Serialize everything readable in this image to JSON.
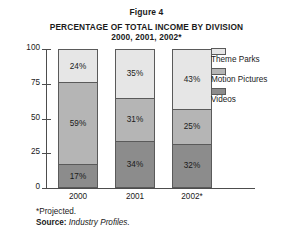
{
  "figure": {
    "label": "Figure 4",
    "title": "PERCENTAGE OF TOTAL INCOME BY DIVISION",
    "subtitle": "2000, 2001, 2002*"
  },
  "notes": {
    "projected": "*Projected.",
    "source_label": "Source:",
    "source_value": "Industry Profiles."
  },
  "legend": {
    "position": "right",
    "items": [
      {
        "label": "Theme Parks",
        "color": "#e6e6e6"
      },
      {
        "label": "Motion Pictures",
        "color": "#b5b5b5"
      },
      {
        "label": "Videos",
        "color": "#8c8c8c"
      }
    ]
  },
  "chart_data": {
    "type": "bar",
    "variant": "stacked-vertical",
    "title": "PERCENTAGE OF TOTAL INCOME BY DIVISION",
    "subtitle": "2000, 2001, 2002*",
    "xlabel": "",
    "ylabel": "",
    "ylim": [
      0,
      100
    ],
    "yticks": [
      0,
      25,
      50,
      75,
      100
    ],
    "ytick_labels": [
      "0",
      "25",
      "50",
      "75",
      "100"
    ],
    "grid": false,
    "legend_position": "right",
    "categories": [
      "2000",
      "2001",
      "2002*"
    ],
    "series": [
      {
        "name": "Videos",
        "color": "#8c8c8c",
        "values": [
          17,
          34,
          32
        ],
        "labels": [
          "17%",
          "34%",
          "32%"
        ]
      },
      {
        "name": "Motion Pictures",
        "color": "#b5b5b5",
        "values": [
          59,
          31,
          25
        ],
        "labels": [
          "59%",
          "31%",
          "25%"
        ]
      },
      {
        "name": "Theme Parks",
        "color": "#e6e6e6",
        "values": [
          24,
          35,
          43
        ],
        "labels": [
          "24%",
          "35%",
          "43%"
        ]
      }
    ],
    "bars": [
      {
        "category": "2000",
        "segments": [
          {
            "name": "Videos",
            "value": 17,
            "label": "17%",
            "color": "#8c8c8c"
          },
          {
            "name": "Motion Pictures",
            "value": 59,
            "label": "59%",
            "color": "#b5b5b5"
          },
          {
            "name": "Theme Parks",
            "value": 24,
            "label": "24%",
            "color": "#e6e6e6"
          }
        ],
        "total": 100
      },
      {
        "category": "2001",
        "segments": [
          {
            "name": "Videos",
            "value": 34,
            "label": "34%",
            "color": "#8c8c8c"
          },
          {
            "name": "Motion Pictures",
            "value": 31,
            "label": "31%",
            "color": "#b5b5b5"
          },
          {
            "name": "Theme Parks",
            "value": 35,
            "label": "35%",
            "color": "#e6e6e6"
          }
        ],
        "total": 100
      },
      {
        "category": "2002*",
        "segments": [
          {
            "name": "Videos",
            "value": 32,
            "label": "32%",
            "color": "#8c8c8c"
          },
          {
            "name": "Motion Pictures",
            "value": 25,
            "label": "25%",
            "color": "#b5b5b5"
          },
          {
            "name": "Theme Parks",
            "value": 43,
            "label": "43%",
            "color": "#e6e6e6"
          }
        ],
        "total": 100
      }
    ]
  }
}
